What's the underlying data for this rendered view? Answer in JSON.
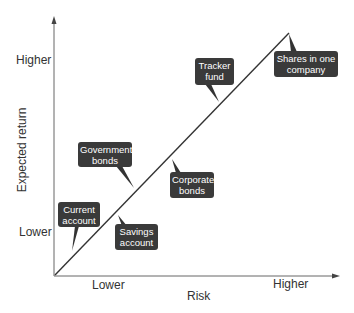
{
  "axes": {
    "x_label": "Risk",
    "y_label": "Expected return",
    "x_ticks": [
      "Lower",
      "Higher"
    ],
    "y_ticks": [
      "Higher",
      "Lower"
    ]
  },
  "items": [
    {
      "line1": "Current",
      "line2": "account"
    },
    {
      "line1": "Savings",
      "line2": "account"
    },
    {
      "line1": "Government",
      "line2": "bonds"
    },
    {
      "line1": "Corporate",
      "line2": "bonds"
    },
    {
      "line1": "Tracker",
      "line2": "fund"
    },
    {
      "line1": "Shares in one",
      "line2": "company"
    }
  ],
  "colors": {
    "axis": "#555555",
    "line": "#333333",
    "box": "#3a3a3a",
    "box_text": "#ffffff"
  }
}
